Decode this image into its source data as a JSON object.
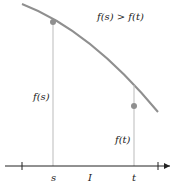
{
  "diagram": {
    "relation": "f(s) > f(t)",
    "left_value_label": "f(s)",
    "right_value_label": "f(t)",
    "axis_labels": {
      "s": "s",
      "interval": "I",
      "t": "t"
    },
    "colors": {
      "curve": "#8f8f8f",
      "point": "#8f8f8f",
      "axis": "#222222",
      "guide": "#bbbbbb"
    }
  }
}
